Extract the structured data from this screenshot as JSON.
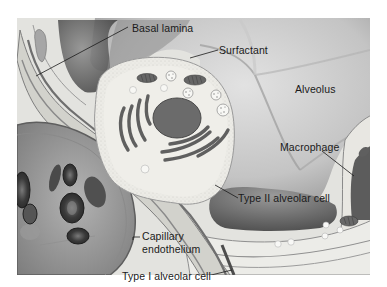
{
  "diagram": {
    "labels": {
      "basal_lamina": "Basal lamina",
      "surfactant": "Surfactant",
      "alveolus": "Alveolus",
      "macrophage": "Macrophage",
      "type2_cell": "Type II alveolar cell",
      "capillary_line1": "Capillary",
      "capillary_line2": "endothelium",
      "type1_cell": "Type I alveolar cell"
    },
    "colors": {
      "background": "#ffffff",
      "alveolus_light": "#d6d6d6",
      "alveolus_mid": "#a9a9a9",
      "alveolus_dark": "#6e6e6e",
      "cell_cytoplasm": "#ecebe6",
      "organelle": "#6a6a6a",
      "membrane": "#8c8c8c",
      "tissue_light": "#e6e6e2",
      "label_text": "#1a1a1a"
    }
  }
}
